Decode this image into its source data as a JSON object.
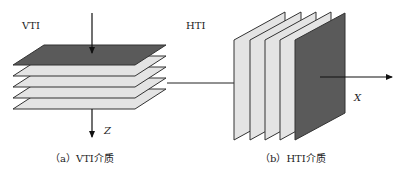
{
  "vti": {
    "title": "VTI",
    "axis_label": "Z",
    "caption": "（a）VTI介质",
    "plate_count": 5,
    "top_plate_color": "#5a5a5a",
    "plate_color": "#e4e4e4"
  },
  "hti": {
    "title": "HTI",
    "axis_label": "X",
    "caption": "（b）HTI介质",
    "plate_count": 5,
    "front_plate_color": "#5a5a5a",
    "plate_color": "#e4e4e4"
  },
  "colors": {
    "stroke": "#222222",
    "background": "#ffffff"
  }
}
